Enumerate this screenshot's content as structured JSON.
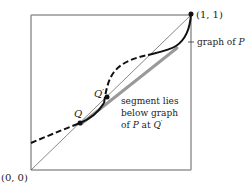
{
  "figure": {
    "labels": {
      "origin": "(0, 0)",
      "corner": "(1, 1)",
      "graph": "graph of",
      "graph_var": "P",
      "q": "Q",
      "q_prime": "Q",
      "q_prime_mark": "′",
      "segment_line1": "segment lies",
      "segment_line2": "below graph",
      "segment_line3_pre": "of ",
      "segment_line3_var": "P",
      "segment_line3_mid": " at ",
      "segment_line3_q": "Q",
      "segment_line3_mark": "′"
    },
    "colors": {
      "curve": "#111111",
      "diagonal": "#555555",
      "segment": "#999999",
      "box": "#444444"
    }
  }
}
